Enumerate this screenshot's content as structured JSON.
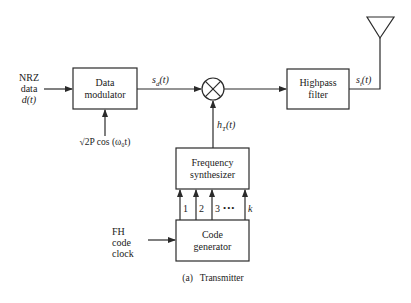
{
  "blocks": {
    "data_modulator": {
      "line1": "Data",
      "line2": "modulator"
    },
    "highpass_filter": {
      "line1": "Highpass",
      "line2": "filter"
    },
    "frequency_synthesizer": {
      "line1": "Frequency",
      "line2": "synthesizer"
    },
    "code_generator": {
      "line1": "Code",
      "line2": "generator"
    }
  },
  "inputs": {
    "nrz": {
      "line1": "NRZ",
      "line2": "data",
      "line3": "d(t)"
    },
    "carrier": "√2P cos (ω₀t)",
    "fh_clock": {
      "line1": "FH",
      "line2": "code",
      "line3": "clock"
    }
  },
  "signals": {
    "sd": "s_d(t)",
    "sd_main": "s",
    "sd_sub": "d",
    "sd_arg": "(t)",
    "hT_main": "h",
    "hT_sub": "T",
    "hT_arg": "(t)",
    "st_main": "s",
    "st_sub": "t",
    "st_arg": "(t)"
  },
  "code_lines": [
    "1",
    "2",
    "3",
    "•••",
    "k"
  ],
  "caption": "(a)   Transmitter",
  "colors": {
    "stroke": "#2a2a2a",
    "background": "#ffffff"
  }
}
